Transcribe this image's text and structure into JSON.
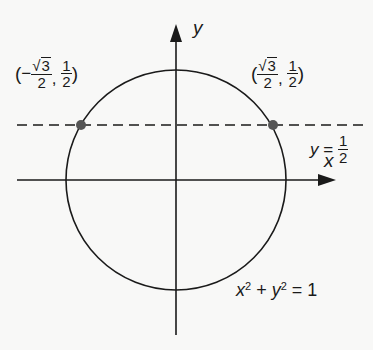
{
  "diagram": {
    "type": "unit-circle-intersection",
    "axes": {
      "x_label": "x",
      "y_label": "y"
    },
    "circle": {
      "equation_lhs_x": "x",
      "equation_lhs_exp1": "2",
      "equation_plus": "+",
      "equation_lhs_y": "y",
      "equation_lhs_exp2": "2",
      "equation_eq": "=",
      "equation_rhs": "1"
    },
    "line": {
      "var": "y",
      "eq": "=",
      "num": "1",
      "den": "2",
      "style": "dashed"
    },
    "points": [
      {
        "name": "left-intersection",
        "open": "(",
        "sign": "−",
        "sqrt_symbol": "√",
        "radicand": "3",
        "x_den": "2",
        "comma": ",",
        "y_num": "1",
        "y_den": "2",
        "close": ")"
      },
      {
        "name": "right-intersection",
        "open": "(",
        "sign": "",
        "sqrt_symbol": "√",
        "radicand": "3",
        "x_den": "2",
        "comma": ",",
        "y_num": "1",
        "y_den": "2",
        "close": ")"
      }
    ],
    "colors": {
      "background": "#f8f8f7",
      "stroke": "#1a1a1a",
      "point": "#555555"
    }
  }
}
